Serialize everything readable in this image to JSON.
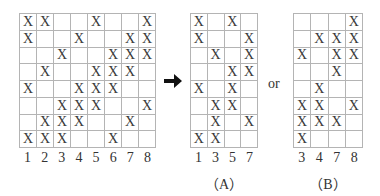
{
  "mark": "X",
  "main": {
    "columns": [
      "1",
      "2",
      "3",
      "4",
      "5",
      "6",
      "7",
      "8"
    ],
    "rows": [
      [
        1,
        1,
        0,
        0,
        1,
        0,
        0,
        1
      ],
      [
        1,
        0,
        0,
        1,
        0,
        0,
        1,
        1
      ],
      [
        0,
        0,
        1,
        0,
        0,
        1,
        1,
        1
      ],
      [
        0,
        1,
        0,
        0,
        1,
        1,
        1,
        0
      ],
      [
        1,
        0,
        0,
        1,
        1,
        1,
        0,
        0
      ],
      [
        0,
        0,
        1,
        1,
        1,
        0,
        0,
        1
      ],
      [
        0,
        1,
        1,
        1,
        0,
        0,
        1,
        0
      ],
      [
        1,
        1,
        1,
        0,
        0,
        1,
        0,
        0
      ]
    ]
  },
  "arrow_icon": "right-arrow-icon",
  "connector_text": "or",
  "option_a": {
    "caption": "（A）",
    "columns": [
      "1",
      "3",
      "5",
      "7"
    ],
    "rows": [
      [
        1,
        0,
        1,
        0
      ],
      [
        1,
        0,
        0,
        1
      ],
      [
        0,
        1,
        0,
        1
      ],
      [
        0,
        0,
        1,
        1
      ],
      [
        1,
        0,
        1,
        0
      ],
      [
        0,
        1,
        1,
        0
      ],
      [
        0,
        1,
        0,
        1
      ],
      [
        1,
        1,
        0,
        0
      ]
    ]
  },
  "option_b": {
    "caption": "（B）",
    "columns": [
      "3",
      "4",
      "7",
      "8"
    ],
    "rows": [
      [
        0,
        0,
        0,
        1
      ],
      [
        0,
        1,
        1,
        1
      ],
      [
        1,
        0,
        1,
        1
      ],
      [
        0,
        0,
        1,
        0
      ],
      [
        0,
        1,
        0,
        0
      ],
      [
        1,
        1,
        0,
        1
      ],
      [
        1,
        1,
        1,
        0
      ],
      [
        1,
        0,
        0,
        0
      ]
    ]
  }
}
